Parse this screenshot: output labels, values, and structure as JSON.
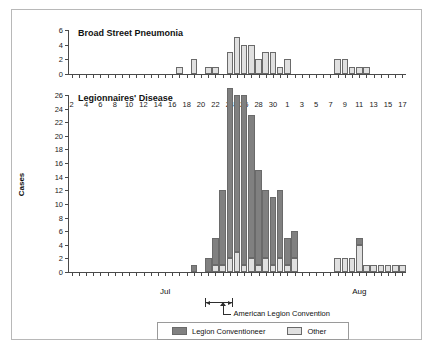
{
  "figure": {
    "background": "#ffffff",
    "frame_color": "#b8b8b8",
    "colors": {
      "legion": "#808080",
      "other": "#e0e0e0",
      "bar_border": "#6a6a6a",
      "axis": "#4a4a4a",
      "text": "#111111"
    }
  },
  "axis": {
    "cases_label": "Cases",
    "month_jul": "Jul",
    "month_aug": "Aug",
    "x_tick_labels": [
      "2",
      "4",
      "6",
      "8",
      "10",
      "12",
      "14",
      "16",
      "18",
      "20",
      "22",
      "24",
      "26",
      "28",
      "30",
      "1",
      "3",
      "5",
      "7",
      "9",
      "11",
      "13",
      "15",
      "17"
    ],
    "top_y_tick_labels": [
      "0",
      "2",
      "4",
      "6"
    ],
    "main_y_tick_labels": [
      "0",
      "2",
      "4",
      "6",
      "8",
      "10",
      "12",
      "14",
      "16",
      "18",
      "20",
      "22",
      "24",
      "26"
    ]
  },
  "annotation": {
    "convention_caption": "American Legion Convention",
    "convention_start": "Jul 21",
    "convention_end": "Jul 24",
    "convention_peak_marker": "Jul 23"
  },
  "legend": {
    "items": [
      {
        "label": "Legion Conventioneer",
        "color": "#808080"
      },
      {
        "label": "Other",
        "color": "#e0e0e0"
      }
    ]
  },
  "chart_data": [
    {
      "type": "bar",
      "title": "Broad Street Pneumonia",
      "xlabel": "",
      "ylabel": "Cases",
      "ylim": [
        0,
        6
      ],
      "ytick_step": 2,
      "grid": false,
      "x": [
        "Jul 2",
        "Jul 3",
        "Jul 4",
        "Jul 5",
        "Jul 6",
        "Jul 7",
        "Jul 8",
        "Jul 9",
        "Jul 10",
        "Jul 11",
        "Jul 12",
        "Jul 13",
        "Jul 14",
        "Jul 15",
        "Jul 16",
        "Jul 17",
        "Jul 18",
        "Jul 19",
        "Jul 20",
        "Jul 21",
        "Jul 22",
        "Jul 23",
        "Jul 24",
        "Jul 25",
        "Jul 26",
        "Jul 27",
        "Jul 28",
        "Jul 29",
        "Jul 30",
        "Jul 31",
        "Aug 1",
        "Aug 2",
        "Aug 3",
        "Aug 4",
        "Aug 5",
        "Aug 6",
        "Aug 7",
        "Aug 8",
        "Aug 9",
        "Aug 10",
        "Aug 11",
        "Aug 12",
        "Aug 13",
        "Aug 14",
        "Aug 15",
        "Aug 16",
        "Aug 17"
      ],
      "series": [
        {
          "name": "Other",
          "color": "#e0e0e0",
          "values": [
            0,
            0,
            0,
            0,
            0,
            0,
            0,
            0,
            0,
            0,
            0,
            0,
            0,
            0,
            0,
            1,
            0,
            2,
            0,
            1,
            1,
            0,
            3,
            5,
            4,
            4,
            2,
            3,
            3,
            1,
            2,
            0,
            0,
            0,
            0,
            0,
            0,
            2,
            2,
            1,
            1,
            1,
            0,
            0,
            0,
            0,
            0
          ]
        }
      ]
    },
    {
      "type": "bar",
      "title": "Legionnaires' Disease",
      "xlabel": "",
      "ylabel": "Cases",
      "ylim": [
        0,
        26
      ],
      "ytick_step": 2,
      "grid": false,
      "stacked": true,
      "x": [
        "Jul 2",
        "Jul 3",
        "Jul 4",
        "Jul 5",
        "Jul 6",
        "Jul 7",
        "Jul 8",
        "Jul 9",
        "Jul 10",
        "Jul 11",
        "Jul 12",
        "Jul 13",
        "Jul 14",
        "Jul 15",
        "Jul 16",
        "Jul 17",
        "Jul 18",
        "Jul 19",
        "Jul 20",
        "Jul 21",
        "Jul 22",
        "Jul 23",
        "Jul 24",
        "Jul 25",
        "Jul 26",
        "Jul 27",
        "Jul 28",
        "Jul 29",
        "Jul 30",
        "Jul 31",
        "Aug 1",
        "Aug 2",
        "Aug 3",
        "Aug 4",
        "Aug 5",
        "Aug 6",
        "Aug 7",
        "Aug 8",
        "Aug 9",
        "Aug 10",
        "Aug 11",
        "Aug 12",
        "Aug 13",
        "Aug 14",
        "Aug 15",
        "Aug 16",
        "Aug 17"
      ],
      "series": [
        {
          "name": "Legion Conventioneer",
          "color": "#808080",
          "values": [
            0,
            0,
            0,
            0,
            0,
            0,
            0,
            0,
            0,
            0,
            0,
            0,
            0,
            0,
            0,
            0,
            0,
            1,
            0,
            2,
            4,
            11,
            25,
            23,
            25,
            21,
            14,
            10,
            10,
            10,
            4,
            4,
            0,
            0,
            0,
            0,
            0,
            0,
            0,
            0,
            1,
            0,
            0,
            0,
            0,
            0,
            0
          ]
        },
        {
          "name": "Other",
          "color": "#e0e0e0",
          "values": [
            0,
            0,
            0,
            0,
            0,
            0,
            0,
            0,
            0,
            0,
            0,
            0,
            0,
            0,
            0,
            0,
            0,
            0,
            0,
            0,
            1,
            1,
            2,
            3,
            1,
            2,
            1,
            2,
            1,
            2,
            1,
            2,
            0,
            0,
            0,
            0,
            0,
            2,
            2,
            2,
            4,
            1,
            1,
            1,
            1,
            1,
            1
          ]
        }
      ]
    }
  ]
}
